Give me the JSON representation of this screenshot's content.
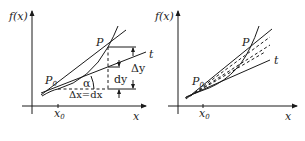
{
  "figure": {
    "left_panel": {
      "y_axis_label": "f(x)",
      "x_axis_label": "x",
      "x_tick_label": "x",
      "x_tick_sub": "0",
      "point_p0_label": "P",
      "point_p0_sub": "0",
      "point_p_label": "P",
      "tangent_label": "t",
      "angle_label": "α",
      "delta_x_label": "Δx=dx",
      "delta_y_label": "Δy",
      "dy_label": "dy"
    },
    "right_panel": {
      "y_axis_label": "f(x)",
      "x_axis_label": "x",
      "x_tick_label": "x",
      "x_tick_sub": "0",
      "point_p0_label": "P",
      "point_p0_sub": "0",
      "point_p_label": "P",
      "tangent_label": "t"
    },
    "colors": {
      "ink": "#1a1a1a",
      "background": "#ffffff"
    }
  }
}
